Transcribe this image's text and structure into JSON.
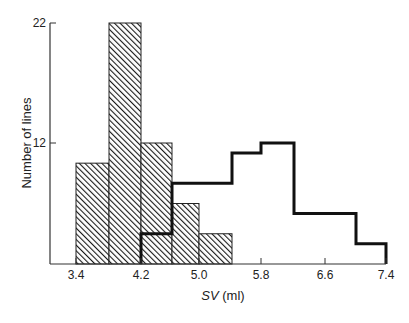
{
  "chart_data": {
    "type": "bar",
    "subtype": "overlaid-histogram",
    "title": "",
    "xlabel_italic": "SV",
    "xlabel_rest": " (ml)",
    "xlabel": "SV (ml)",
    "ylabel": "Number of lines",
    "x_ticks": [
      "3.4",
      "4.2",
      "5.0",
      "5.8",
      "6.6",
      "7.4"
    ],
    "y_ticks": [
      "12",
      "22"
    ],
    "xlim": [
      3.4,
      7.4
    ],
    "ylim": [
      0,
      22
    ],
    "grid": false,
    "legend": null,
    "series": [
      {
        "name": "hatched",
        "style": "diagonal-hatch fill",
        "bin_edges": [
          3.4,
          3.8,
          4.2,
          4.6,
          5.0,
          5.4
        ],
        "values": [
          10,
          22,
          12,
          6,
          3
        ]
      },
      {
        "name": "open",
        "style": "thick outline, no fill",
        "bin_edges": [
          4.2,
          4.6,
          5.4,
          5.8,
          6.2,
          7.0,
          7.4
        ],
        "values": [
          3,
          8,
          11,
          12,
          5,
          2
        ]
      }
    ]
  }
}
